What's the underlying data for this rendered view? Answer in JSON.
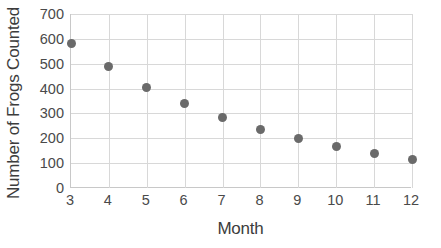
{
  "chart_data": {
    "type": "scatter",
    "title": "",
    "xlabel": "Month",
    "ylabel": "Number of Frogs Counted",
    "x": [
      3,
      4,
      5,
      6,
      7,
      8,
      9,
      10,
      11,
      12
    ],
    "values": [
      580,
      487,
      405,
      338,
      283,
      237,
      198,
      165,
      140,
      116
    ],
    "series": [
      {
        "name": "Frogs Counted",
        "values": [
          580,
          487,
          405,
          338,
          283,
          237,
          198,
          165,
          140,
          116
        ]
      }
    ],
    "xlim": [
      3,
      12
    ],
    "ylim": [
      0,
      700
    ],
    "xticks": [
      "3",
      "4",
      "5",
      "6",
      "7",
      "8",
      "9",
      "10",
      "11",
      "12"
    ],
    "yticks": [
      "0",
      "100",
      "200",
      "300",
      "400",
      "500",
      "600",
      "700"
    ],
    "grid": true,
    "legend": false,
    "legend_position": "none",
    "marker_color": "#6a6a6a",
    "gridline_color": "#d8d8d8",
    "axis_color": "#c8c8c8",
    "text_color": "#3c3c3c",
    "tick_text_color": "#4a4a4a",
    "background_color": "#ffffff"
  }
}
